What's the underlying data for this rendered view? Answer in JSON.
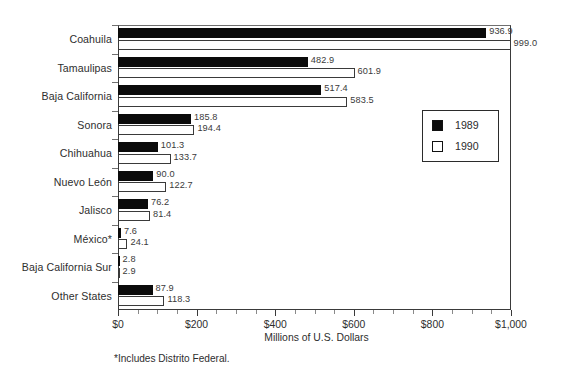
{
  "chart_data": {
    "type": "bar",
    "orientation": "horizontal",
    "title": "",
    "xlabel": "Millions of U.S. Dollars",
    "ylabel": "",
    "xlim": [
      0,
      1000
    ],
    "grid": false,
    "legend_position": "middle-right",
    "categories": [
      "Coahuila",
      "Tamaulipas",
      "Baja California",
      "Sonora",
      "Chihuahua",
      "Nuevo León",
      "Jalisco",
      "México*",
      "Baja California Sur",
      "Other States"
    ],
    "series": [
      {
        "name": "1989",
        "color": "#0b0b0b",
        "values": [
          936.9,
          482.9,
          517.4,
          185.8,
          101.3,
          90.0,
          76.2,
          7.6,
          2.8,
          87.9
        ],
        "labels": [
          "936.9",
          "482.9",
          "517.4",
          "185.8",
          "101.3",
          "90.0",
          "76.2",
          "7.6",
          "2.8",
          "87.9"
        ]
      },
      {
        "name": "1990",
        "color": "#ffffff",
        "values": [
          999.0,
          601.9,
          583.5,
          194.4,
          133.7,
          122.7,
          81.4,
          24.1,
          2.9,
          118.3
        ],
        "labels": [
          "999.0",
          "601.9",
          "583.5",
          "194.4",
          "133.7",
          "122.7",
          "81.4",
          "24.1",
          "2.9",
          "118.3"
        ]
      }
    ],
    "x_ticks": [
      0,
      200,
      400,
      600,
      800,
      1000
    ],
    "x_tick_labels": [
      "$0",
      "$200",
      "$400",
      "$600",
      "$800",
      "$1,000"
    ],
    "x_minor_tick_step": 50,
    "footnote": "*Includes Distrito Federal."
  },
  "legend": {
    "items": [
      {
        "label": "1989",
        "style": "filled"
      },
      {
        "label": "1990",
        "style": "hollow"
      }
    ]
  }
}
